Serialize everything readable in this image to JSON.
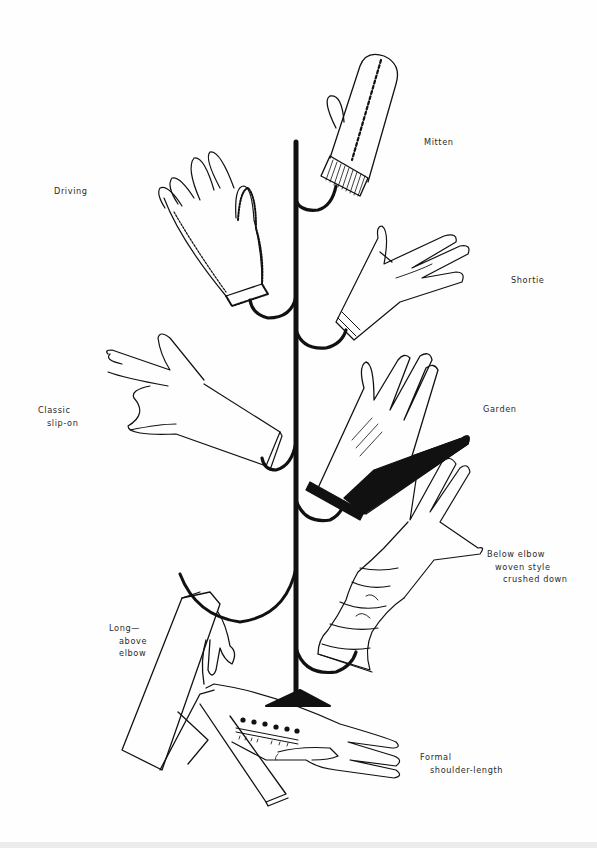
{
  "figure": {
    "colors": {
      "ink": "#111111",
      "paper": "#fefefe",
      "label_text": "#2a2a2a"
    }
  },
  "labels": {
    "mitten": {
      "lines": [
        "Mitten"
      ]
    },
    "driving": {
      "lines": [
        "Driving"
      ]
    },
    "shortie": {
      "lines": [
        "Shortie"
      ]
    },
    "classic": {
      "lines": [
        "Classic",
        "slip-on"
      ]
    },
    "garden": {
      "lines": [
        "Garden"
      ]
    },
    "below_elbow": {
      "lines": [
        "Below elbow",
        "woven style",
        "crushed down"
      ]
    },
    "long": {
      "lines": [
        "Long—",
        "above",
        "elbow"
      ]
    },
    "formal": {
      "lines": [
        "Formal",
        "shoulder-length"
      ]
    }
  },
  "gloves": [
    {
      "id": "mitten",
      "style": "knit mitten with ribbed cuff"
    },
    {
      "id": "driving",
      "style": "crocheted back, open knuckles"
    },
    {
      "id": "shortie",
      "style": "wrist-length with banded cuff"
    },
    {
      "id": "classic",
      "style": "plain slip-on"
    },
    {
      "id": "garden",
      "style": "dark palm and cuff"
    },
    {
      "id": "below_elbow",
      "style": "woven, crushed down"
    },
    {
      "id": "long",
      "style": "above elbow"
    },
    {
      "id": "formal",
      "style": "shoulder-length with button placket"
    }
  ]
}
